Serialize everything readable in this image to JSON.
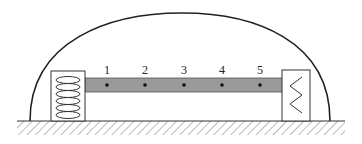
{
  "diagram": {
    "points": [
      {
        "label": "1",
        "x": 107
      },
      {
        "label": "2",
        "x": 145
      },
      {
        "label": "3",
        "x": 184
      },
      {
        "label": "4",
        "x": 222
      },
      {
        "label": "5",
        "x": 260
      }
    ],
    "colors": {
      "bar": "#9a9a9a",
      "line": "#222222",
      "background": "#ffffff"
    },
    "left_spring": "coil-spring",
    "right_spring": "zigzag-spring"
  }
}
